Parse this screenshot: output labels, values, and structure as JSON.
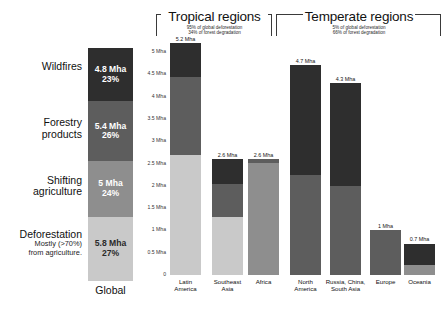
{
  "chart_data": {
    "type": "bar",
    "title": "",
    "xlabel": "",
    "ylabel": "Mha",
    "ylim": [
      0,
      5.25
    ],
    "grid": false,
    "legend_position": "left-labels",
    "stacked": true,
    "axis_ticks": [
      "5 Mha",
      "4.5 Mha",
      "4 Mha",
      "3.5 Mha",
      "3 Mha",
      "2.5 Mha",
      "2 Mha",
      "1.5 Mha",
      "1 Mha",
      "0.5 Mha",
      "0"
    ],
    "axis_tick_values": [
      5,
      4.5,
      4,
      3.5,
      3,
      2.5,
      2,
      1.5,
      1,
      0.5,
      0
    ],
    "series": [
      {
        "name": "Wildfires",
        "color": "#2e2e2e"
      },
      {
        "name": "Forestry products",
        "color": "#5d5d5d"
      },
      {
        "name": "Shifting agriculture",
        "color": "#8e8e8e"
      },
      {
        "name": "Deforestation",
        "color": "#c9c9c9"
      }
    ],
    "global": {
      "caption": "Global",
      "categories": [
        "Wildfires",
        "Forestry products",
        "Shifting agriculture",
        "Deforestation"
      ],
      "values": [
        4.8,
        5.4,
        5.0,
        5.8
      ],
      "percents": [
        23,
        26,
        24,
        27
      ],
      "labels": [
        {
          "value": "4.8 Mha",
          "percent": "23%"
        },
        {
          "value": "5.4 Mha",
          "percent": "26%"
        },
        {
          "value": "5 Mha",
          "percent": "24%"
        },
        {
          "value": "5.8 Mha",
          "percent": "27%"
        }
      ],
      "row_labels": [
        {
          "main": "Wildfires",
          "sub": ""
        },
        {
          "main": "Forestry",
          "sub": "products"
        },
        {
          "main": "Shifting",
          "sub": "agriculture"
        },
        {
          "main": "Deforestation",
          "sub": "Mostly (>70%)|from agriculture."
        }
      ]
    },
    "groups": [
      {
        "title": "Tropical regions",
        "sub_line1": "95% of global deforestation",
        "sub_line2": "34% of forest degradation",
        "bars": [
          {
            "label_line1": "Latin",
            "label_line2": "America",
            "total": "5.2 Mha",
            "total_value": 5.2,
            "segments": [
              {
                "series": "Wildfires",
                "value": 0.75
              },
              {
                "series": "Forestry products",
                "value": 1.75
              },
              {
                "series": "Deforestation",
                "value": 2.7
              }
            ]
          },
          {
            "label_line1": "Southeast",
            "label_line2": "Asia",
            "total": "2.6 Mha",
            "total_value": 2.6,
            "segments": [
              {
                "series": "Wildfires",
                "value": 0.55
              },
              {
                "series": "Forestry products",
                "value": 0.75
              },
              {
                "series": "Deforestation",
                "value": 1.3
              }
            ]
          },
          {
            "label_line1": "Africa",
            "label_line2": "",
            "total": "2.6 Mha",
            "total_value": 2.6,
            "segments": [
              {
                "series": "Forestry products",
                "value": 0.1
              },
              {
                "series": "Shifting agriculture",
                "value": 2.5
              }
            ]
          }
        ]
      },
      {
        "title": "Temperate regions",
        "sub_line1": "5% of global deforestation",
        "sub_line2": "66% of forest degradation",
        "bars": [
          {
            "label_line1": "North",
            "label_line2": "America",
            "total": "4.7 Mha",
            "total_value": 4.7,
            "segments": [
              {
                "series": "Wildfires",
                "value": 2.45
              },
              {
                "series": "Forestry products",
                "value": 2.25
              }
            ]
          },
          {
            "label_line1": "Russia, China,",
            "label_line2": "South Asia",
            "total": "4.3 Mha",
            "total_value": 4.3,
            "segments": [
              {
                "series": "Wildfires",
                "value": 2.3
              },
              {
                "series": "Forestry products",
                "value": 2.0
              }
            ]
          },
          {
            "label_line1": "Europe",
            "label_line2": "",
            "total": "1 Mha",
            "total_value": 1.0,
            "segments": [
              {
                "series": "Forestry products",
                "value": 1.0
              }
            ]
          },
          {
            "label_line1": "Oceania",
            "label_line2": "",
            "total": "0.7 Mha",
            "total_value": 0.7,
            "segments": [
              {
                "series": "Wildfires",
                "value": 0.47
              },
              {
                "series": "Shifting agriculture",
                "value": 0.23
              }
            ]
          }
        ]
      }
    ]
  }
}
